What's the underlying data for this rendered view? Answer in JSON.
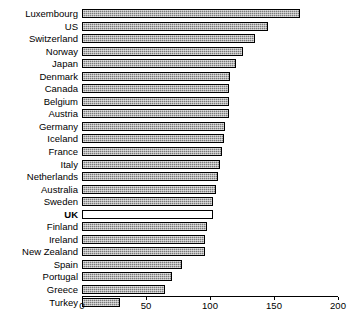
{
  "chart_data": {
    "type": "bar",
    "orientation": "horizontal",
    "title": "",
    "subtitle": "",
    "xlabel": "",
    "ylabel": "",
    "xlim": [
      0,
      200
    ],
    "xticks": [
      0,
      50,
      100,
      150,
      200
    ],
    "grid": false,
    "legend": null,
    "highlight_category": "UK",
    "categories": [
      "Luxembourg",
      "US",
      "Switzerland",
      "Norway",
      "Japan",
      "Denmark",
      "Canada",
      "Belgium",
      "Austria",
      "Germany",
      "Iceland",
      "France",
      "Italy",
      "Netherlands",
      "Australia",
      "Sweden",
      "UK",
      "Finland",
      "Ireland",
      "New Zealand",
      "Spain",
      "Portugal",
      "Greece",
      "Turkey"
    ],
    "values": [
      170,
      145,
      135,
      126,
      120,
      116,
      115,
      115,
      115,
      112,
      111,
      109,
      108,
      106,
      105,
      102,
      102,
      98,
      96,
      96,
      78,
      70,
      65,
      30
    ]
  },
  "colors": {
    "bar_fill": "#7a7a7a",
    "bar_border": "#000000",
    "highlight_fill": "#ffffff",
    "axis": "#000000",
    "background": "#ffffff",
    "text": "#000000"
  }
}
